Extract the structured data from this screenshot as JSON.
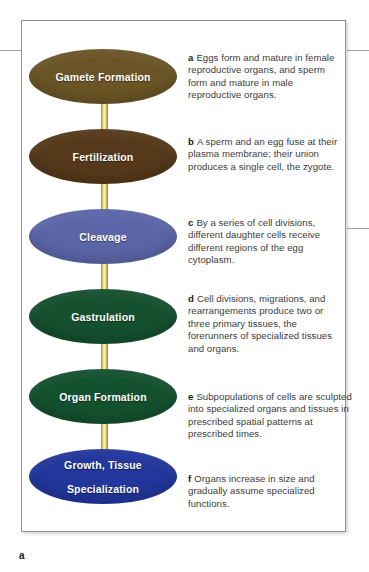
{
  "figure": {
    "part_label": "a",
    "accent_arrow_color": "#e3ce62",
    "border_color": "#8d9296"
  },
  "chart_data": {
    "type": "diagram",
    "layout": "vertical flowchart, ellipse nodes with downward arrows, captions at right",
    "nodes": [
      {
        "id": "a",
        "label": "Gamete Formation",
        "color": "#6b5526"
      },
      {
        "id": "b",
        "label": "Fertilization",
        "color": "#55391a"
      },
      {
        "id": "c",
        "label": "Cleavage",
        "color": "#5b66a8"
      },
      {
        "id": "d",
        "label": "Gastrulation",
        "color": "#15502f"
      },
      {
        "id": "e",
        "label": "Organ Formation",
        "color": "#14512f"
      },
      {
        "id": "f",
        "label": "Growth, Tissue\nSpecialization",
        "color": "#22369c"
      }
    ],
    "edges": [
      {
        "from": "a",
        "to": "b"
      },
      {
        "from": "b",
        "to": "c"
      },
      {
        "from": "c",
        "to": "d"
      },
      {
        "from": "d",
        "to": "e"
      },
      {
        "from": "e",
        "to": "f"
      }
    ]
  },
  "stages": [
    {
      "marker": "a",
      "label": "Gamete Formation",
      "label_line1": "Gamete Formation",
      "label_line2": "",
      "color": "#6b5526",
      "caption": "Eggs form and mature in female reproductive organs, and sperm form and mature in male reproductive organs."
    },
    {
      "marker": "b",
      "label": "Fertilization",
      "label_line1": "Fertilization",
      "label_line2": "",
      "color": "#55391a",
      "caption": "A sperm and an egg fuse at their plasma membrane; their union produces a single cell, the zygote."
    },
    {
      "marker": "c",
      "label": "Cleavage",
      "label_line1": "Cleavage",
      "label_line2": "",
      "color": "#5b66a8",
      "caption": "By a series of cell divisions, different daughter cells receive different regions of the egg cytoplasm."
    },
    {
      "marker": "d",
      "label": "Gastrulation",
      "label_line1": "Gastrulation",
      "label_line2": "",
      "color": "#15502f",
      "caption": "Cell divisions, migrations, and rearrangements produce two or three primary tissues, the forerunners of specialized tissues and organs."
    },
    {
      "marker": "e",
      "label": "Organ Formation",
      "label_line1": "Organ Formation",
      "label_line2": "",
      "color": "#14512f",
      "caption": "Subpopulations of cells are sculpted into specialized organs and tissues in prescribed spatial patterns at prescribed times."
    },
    {
      "marker": "f",
      "label": "Growth, Tissue Specialization",
      "label_line1": "Growth, Tissue",
      "label_line2": "Specialization",
      "color": "#22369c",
      "caption": "Organs increase in size and gradually assume specialized functions."
    }
  ]
}
